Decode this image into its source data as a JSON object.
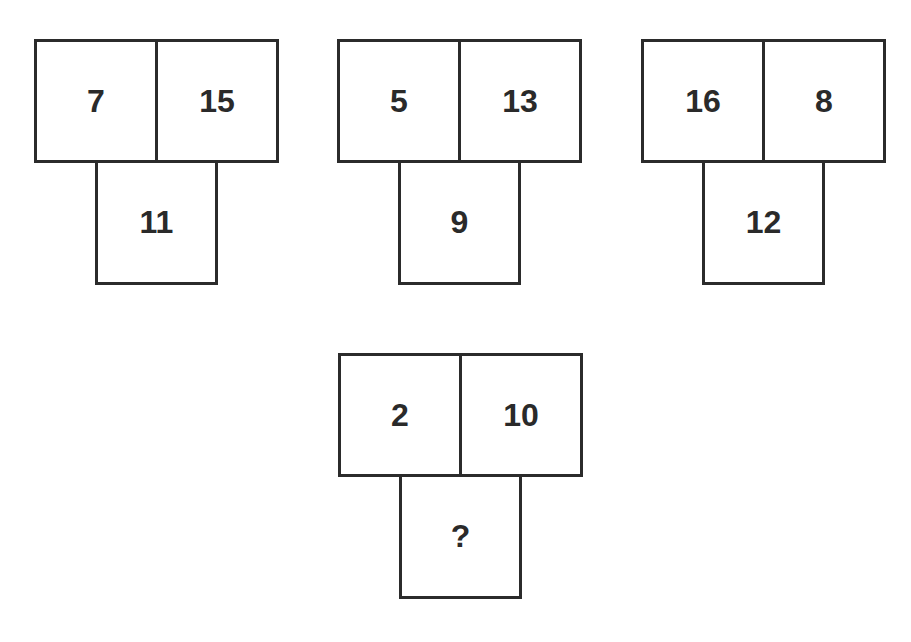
{
  "puzzles": [
    {
      "top_left": "7",
      "top_right": "15",
      "bottom": "11"
    },
    {
      "top_left": "5",
      "top_right": "13",
      "bottom": "9"
    },
    {
      "top_left": "16",
      "top_right": "8",
      "bottom": "12"
    },
    {
      "top_left": "2",
      "top_right": "10",
      "bottom": "?"
    }
  ]
}
